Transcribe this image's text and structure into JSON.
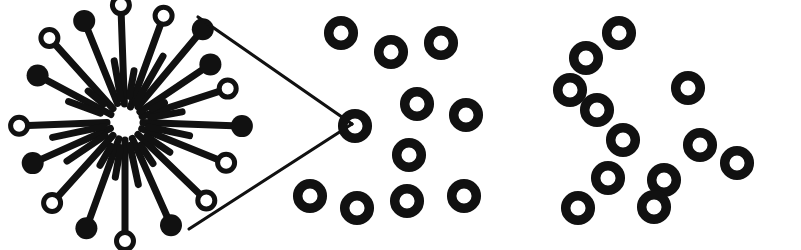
{
  "figure": {
    "background_color": "#ffffff",
    "ink_color": "#111111",
    "width": 801,
    "height": 250
  },
  "style": {
    "ring_outer_radius": 17,
    "ring_stroke_width": 9.5,
    "pin_rod_width": 7,
    "pin_head_radius": 11,
    "pin_head_stroke_width": 5,
    "wedge_line_width": 3.2
  },
  "panels": [
    {
      "id": "micelle-cluster",
      "name": "micelle-cluster",
      "label": "radial pin cluster",
      "center_x": 125,
      "center_y": 122,
      "core_radius": 20
    },
    {
      "id": "magnifier-wedge",
      "name": "magnifier-wedge",
      "label": "callout wedge",
      "apex_x": 352,
      "apex_y": 124
    },
    {
      "id": "vesicle-cluster-middle",
      "name": "vesicle-cluster-middle",
      "label": "middle ring cluster"
    },
    {
      "id": "vesicle-cluster-right",
      "name": "vesicle-cluster-right",
      "label": "right ring cluster"
    }
  ],
  "micelle": {
    "center": {
      "x": 125,
      "y": 122
    },
    "pins": [
      {
        "angle": -92,
        "tail": 18,
        "length": 108,
        "head": "hollow"
      },
      {
        "angle": -70,
        "tail": 16,
        "length": 104,
        "head": "hollow"
      },
      {
        "angle": -50,
        "tail": 20,
        "length": 112,
        "head": "filled"
      },
      {
        "angle": -112,
        "tail": 20,
        "length": 100,
        "head": "filled"
      },
      {
        "angle": -132,
        "tail": 18,
        "length": 104,
        "head": "hollow"
      },
      {
        "angle": -152,
        "tail": 16,
        "length": 90,
        "head": "filled"
      },
      {
        "angle": 178,
        "tail": 18,
        "length": 97,
        "head": "hollow"
      },
      {
        "angle": 156,
        "tail": 16,
        "length": 92,
        "head": "filled"
      },
      {
        "angle": 132,
        "tail": 18,
        "length": 100,
        "head": "hollow"
      },
      {
        "angle": 110,
        "tail": 18,
        "length": 104,
        "head": "filled"
      },
      {
        "angle": 90,
        "tail": 18,
        "length": 110,
        "head": "hollow"
      },
      {
        "angle": 66,
        "tail": 18,
        "length": 104,
        "head": "filled"
      },
      {
        "angle": 44,
        "tail": 18,
        "length": 104,
        "head": "hollow"
      },
      {
        "angle": 22,
        "tail": 18,
        "length": 100,
        "head": "hollow"
      },
      {
        "angle": 2,
        "tail": 18,
        "length": 108,
        "head": "filled"
      },
      {
        "angle": -18,
        "tail": 18,
        "length": 99,
        "head": "hollow"
      },
      {
        "angle": -34,
        "tail": 18,
        "length": 94,
        "head": "filled"
      },
      {
        "angle": -60,
        "tail": 22,
        "length": 76,
        "head": "none"
      },
      {
        "angle": 168,
        "tail": 22,
        "length": 74,
        "head": "none"
      },
      {
        "angle": 12,
        "tail": 24,
        "length": 66,
        "head": "none"
      },
      {
        "angle": 146,
        "tail": 24,
        "length": 70,
        "head": "none"
      },
      {
        "angle": -100,
        "tail": 24,
        "length": 62,
        "head": "none"
      },
      {
        "angle": 78,
        "tail": 24,
        "length": 64,
        "head": "none"
      },
      {
        "angle": -10,
        "tail": 26,
        "length": 58,
        "head": "none"
      },
      {
        "angle": -160,
        "tail": 26,
        "length": 60,
        "head": "none"
      },
      {
        "angle": 100,
        "tail": 26,
        "length": 56,
        "head": "none"
      },
      {
        "angle": 34,
        "tail": 26,
        "length": 54,
        "head": "none"
      },
      {
        "angle": -80,
        "tail": 26,
        "length": 52,
        "head": "none"
      },
      {
        "angle": 120,
        "tail": 28,
        "length": 50,
        "head": "none"
      },
      {
        "angle": -140,
        "tail": 28,
        "length": 48,
        "head": "none"
      },
      {
        "angle": 56,
        "tail": 28,
        "length": 50,
        "head": "none"
      },
      {
        "angle": -26,
        "tail": 30,
        "length": 44,
        "head": "none"
      }
    ]
  },
  "wedge": {
    "apex": {
      "x": 352,
      "y": 124
    },
    "upper_start": {
      "x": 198,
      "y": 17
    },
    "lower_start": {
      "x": 189,
      "y": 229
    },
    "apex_ring": {
      "cx": 355,
      "cy": 126
    }
  },
  "rings_middle": [
    {
      "cx": 341,
      "cy": 33
    },
    {
      "cx": 391,
      "cy": 52
    },
    {
      "cx": 441,
      "cy": 43
    },
    {
      "cx": 355,
      "cy": 126
    },
    {
      "cx": 417,
      "cy": 104
    },
    {
      "cx": 466,
      "cy": 115
    },
    {
      "cx": 409,
      "cy": 155
    },
    {
      "cx": 310,
      "cy": 196
    },
    {
      "cx": 357,
      "cy": 208
    },
    {
      "cx": 407,
      "cy": 201
    },
    {
      "cx": 464,
      "cy": 196
    }
  ],
  "rings_right": [
    {
      "cx": 619,
      "cy": 33
    },
    {
      "cx": 586,
      "cy": 58
    },
    {
      "cx": 570,
      "cy": 90
    },
    {
      "cx": 597,
      "cy": 110
    },
    {
      "cx": 623,
      "cy": 140
    },
    {
      "cx": 688,
      "cy": 88
    },
    {
      "cx": 700,
      "cy": 145
    },
    {
      "cx": 737,
      "cy": 163
    },
    {
      "cx": 664,
      "cy": 180
    },
    {
      "cx": 608,
      "cy": 178
    },
    {
      "cx": 578,
      "cy": 208
    },
    {
      "cx": 654,
      "cy": 207
    }
  ]
}
